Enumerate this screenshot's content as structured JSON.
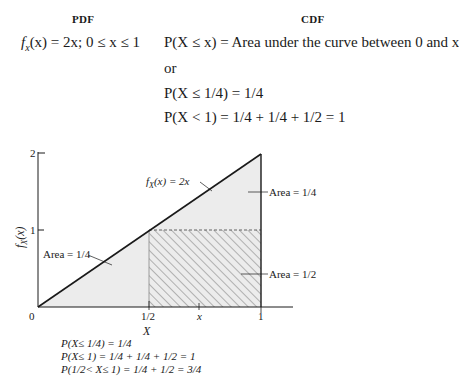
{
  "headers": {
    "pdf": "PDF",
    "cdf": "CDF"
  },
  "pdf_formula": {
    "lhs": "f",
    "sub": "x",
    "rest": "(x) = 2x; 0 ≤ x ≤ 1"
  },
  "cdf_lines": [
    "P(X ≤ x) = Area under the curve between 0 and x",
    "or",
    "P(X ≤ 1/4) = 1/4",
    "P(X < 1) = 1/4 + 1/4 + 1/2 = 1"
  ],
  "diagram": {
    "y_ticks": [
      "2",
      "1"
    ],
    "y_label": "f_X(x)",
    "x_ticks": [
      "0",
      "1/2",
      "x",
      "1"
    ],
    "x_label": "X",
    "curve_label": "f_X(x) = 2x",
    "annotations": [
      {
        "label": "Area = 1/4",
        "region": "upper-right triangle"
      },
      {
        "label": "Area = 1/4",
        "region": "lower-left triangle"
      },
      {
        "label": "Area = 1/2",
        "region": "hatched rectangle"
      }
    ],
    "colors": {
      "line": "#1a1a1a",
      "shade": "#ececec",
      "hatch": "#555555"
    }
  },
  "bottom_lines": [
    "P(X≤ 1/4) = 1/4",
    "P(X≤ 1) = 1/4 + 1/4 + 1/2 = 1",
    "P(1/2< X≤ 1) = 1/4 + 1/2 = 3/4"
  ]
}
